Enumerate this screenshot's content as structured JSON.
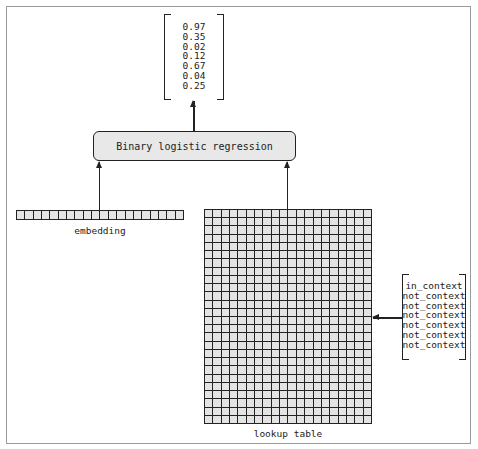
{
  "output_vector": {
    "values": [
      "0.97",
      "0.35",
      "0.02",
      "0.12",
      "0.67",
      "0.04",
      "0.25"
    ]
  },
  "model_box": {
    "label": "Binary logistic regression"
  },
  "embedding": {
    "label": "embedding",
    "cells": 20
  },
  "lookup_table": {
    "label": "lookup table",
    "columns": 20,
    "rows": 26
  },
  "context_labels": {
    "values": [
      "in_context",
      "not_context",
      "not_context",
      "not_context",
      "not_context",
      "not_context",
      "not_context"
    ]
  },
  "colors": {
    "stroke": "#222222",
    "cell_fill": "#e4e4e4",
    "box_fill": "#e8e8e8",
    "frame": "#9a9a9a"
  }
}
